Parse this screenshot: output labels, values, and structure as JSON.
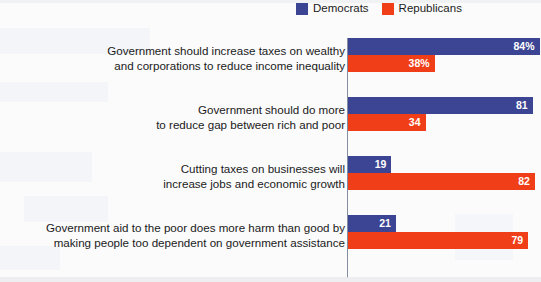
{
  "legend": {
    "items": [
      {
        "label": "Democrats",
        "color": "#3b4593",
        "icon": "square-swatch-icon"
      },
      {
        "label": "Republicans",
        "color": "#ef3e18",
        "icon": "square-swatch-icon"
      }
    ]
  },
  "chart_data": {
    "type": "bar",
    "orientation": "horizontal",
    "title": "",
    "xlabel": "",
    "ylabel": "",
    "xlim": [
      0,
      100
    ],
    "grid": false,
    "legend_position": "top-right",
    "value_suffix_first_group_only": "%",
    "categories": [
      "Government should increase taxes on wealthy\nand corporations to reduce income inequality",
      "Government should do more\nto reduce gap between rich and poor",
      "Cutting taxes on businesses will\nincrease jobs and economic growth",
      "Government aid to the poor does more harm than good by\nmaking people too dependent on government assistance"
    ],
    "series": [
      {
        "name": "Democrats",
        "color": "#3b4593",
        "values": [
          84,
          81,
          19,
          21
        ],
        "labels": [
          "84%",
          "81",
          "19",
          "21"
        ]
      },
      {
        "name": "Republicans",
        "color": "#ef3e18",
        "values": [
          38,
          34,
          82,
          79
        ],
        "labels": [
          "38%",
          "34",
          "82",
          "79"
        ]
      }
    ]
  }
}
